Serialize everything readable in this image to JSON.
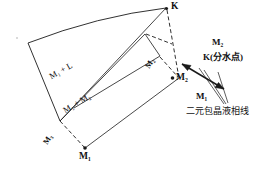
{
  "diagram": {
    "type": "ternary-phase-diagram",
    "title_visible": false,
    "background": "#ffffff",
    "line_color": "#1a1a1a",
    "vertices": [
      {
        "name": "K",
        "label": "K",
        "x": 168,
        "y": 6
      },
      {
        "name": "M1-bottom",
        "label": "M₁",
        "x": 84,
        "y": 157
      },
      {
        "name": "M2-right",
        "label": "M₂",
        "x": 179,
        "y": 78
      }
    ],
    "region_labels": [
      {
        "name": "region-m1-plus-l",
        "label": "M₁ + L",
        "x": 58,
        "y": 66
      },
      {
        "name": "region-m1-plus-m2",
        "label": "M₁  +  M₂",
        "x": 72,
        "y": 99
      }
    ],
    "edge_labels": [
      {
        "name": "edge-m3-left",
        "label": "M₃",
        "x": 50,
        "y": 134
      },
      {
        "name": "edge-m2-upper",
        "label": "M₂",
        "x": 152,
        "y": 58
      }
    ],
    "callouts": {
      "m2_top": "M₂",
      "k_point": "K(分水点)",
      "m1_lower": "M₁",
      "liquidus_line": "二元包晶液相线"
    }
  }
}
